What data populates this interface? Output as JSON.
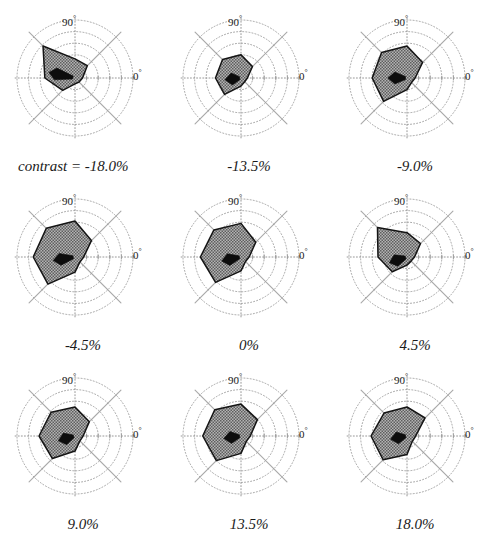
{
  "figure": {
    "type": "polar-tuning-grid",
    "rows": 3,
    "cols": 3,
    "background": "#ffffff",
    "caption_prefix": "contrast = ",
    "axis_labels": {
      "top": "90",
      "right": "0",
      "degree_symbol": "°"
    },
    "colors": {
      "grid": "#9a9a9a",
      "spoke": "#8c8c8c",
      "polygon_fill": "#8f8f8f",
      "polygon_stroke": "#141414",
      "arrow": "#0d0d0d",
      "text": "#1a1a1a"
    }
  },
  "chart_data": {
    "type": "line",
    "title": "",
    "subtitle": "",
    "xlabel": "",
    "ylabel": "",
    "grid": true,
    "legend": "none",
    "coordinate_system": "polar",
    "angular_unit": "degrees",
    "angular_tick_labels": [
      "0",
      "90"
    ],
    "radial_rings": 5,
    "radial_range": [
      0,
      1.0
    ],
    "spokes": 8,
    "spoke_angles": [
      0,
      45,
      90,
      135,
      180,
      225,
      270,
      315
    ],
    "panel_variable": "contrast",
    "panel_unit": "%",
    "series": [
      {
        "name": "contrast = -18.0%",
        "contrast": -18.0,
        "caption": "contrast = -18.0%",
        "caption_value": "-18.0%",
        "angles": [
          0,
          45,
          90,
          135,
          180,
          225,
          270,
          315
        ],
        "values": [
          0.13,
          0.3,
          0.33,
          0.78,
          0.52,
          0.3,
          0.1,
          0.1
        ],
        "vector_angle": 168,
        "vector_length": 0.46
      },
      {
        "name": "-13.5%",
        "contrast": -13.5,
        "caption": "-13.5%",
        "caption_value": "-13.5%",
        "angles": [
          0,
          45,
          90,
          135,
          180,
          225,
          270,
          315
        ],
        "values": [
          0.11,
          0.28,
          0.4,
          0.45,
          0.44,
          0.4,
          0.14,
          0.09
        ],
        "vector_angle": 186,
        "vector_length": 0.28
      },
      {
        "name": "-9.0%",
        "contrast": -9.0,
        "caption": "-9.0%",
        "caption_value": "-9.0%",
        "angles": [
          0,
          45,
          90,
          135,
          180,
          225,
          270,
          315
        ],
        "values": [
          0.14,
          0.38,
          0.55,
          0.62,
          0.6,
          0.57,
          0.2,
          0.11
        ],
        "vector_angle": 180,
        "vector_length": 0.33
      },
      {
        "name": "-4.5%",
        "contrast": -4.5,
        "caption": "-4.5%",
        "caption_value": "-4.5%",
        "angles": [
          0,
          45,
          90,
          135,
          180,
          225,
          270,
          315
        ],
        "values": [
          0.15,
          0.4,
          0.62,
          0.7,
          0.72,
          0.66,
          0.26,
          0.12
        ],
        "vector_angle": 189,
        "vector_length": 0.38
      },
      {
        "name": "0%",
        "contrast": 0,
        "caption": "0%",
        "caption_value": "0%",
        "angles": [
          0,
          45,
          90,
          135,
          180,
          225,
          270,
          315
        ],
        "values": [
          0.14,
          0.36,
          0.58,
          0.66,
          0.7,
          0.62,
          0.24,
          0.11
        ],
        "vector_angle": 192,
        "vector_length": 0.34
      },
      {
        "name": "4.5%",
        "contrast": 4.5,
        "caption": "4.5%",
        "caption_value": "4.5%",
        "angles": [
          0,
          45,
          90,
          135,
          180,
          225,
          270,
          315
        ],
        "values": [
          0.13,
          0.33,
          0.42,
          0.72,
          0.5,
          0.36,
          0.14,
          0.1
        ],
        "vector_angle": 198,
        "vector_length": 0.32
      },
      {
        "name": "9.0%",
        "contrast": 9.0,
        "caption": "9.0%",
        "caption_value": "9.0%",
        "angles": [
          0,
          45,
          90,
          135,
          180,
          225,
          270,
          315
        ],
        "values": [
          0.14,
          0.35,
          0.5,
          0.58,
          0.62,
          0.55,
          0.26,
          0.12
        ],
        "vector_angle": 196,
        "vector_length": 0.3
      },
      {
        "name": "13.5%",
        "contrast": 13.5,
        "caption": "13.5%",
        "caption_value": "13.5%",
        "angles": [
          0,
          45,
          90,
          135,
          180,
          225,
          270,
          315
        ],
        "values": [
          0.16,
          0.4,
          0.55,
          0.64,
          0.66,
          0.6,
          0.3,
          0.13
        ],
        "vector_angle": 188,
        "vector_length": 0.3
      },
      {
        "name": "18.0%",
        "contrast": 18.0,
        "caption": "18.0%",
        "caption_value": "18.0%",
        "angles": [
          0,
          45,
          90,
          135,
          180,
          225,
          270,
          315
        ],
        "values": [
          0.15,
          0.44,
          0.5,
          0.56,
          0.62,
          0.58,
          0.32,
          0.13
        ],
        "vector_angle": 191,
        "vector_length": 0.29
      }
    ]
  }
}
